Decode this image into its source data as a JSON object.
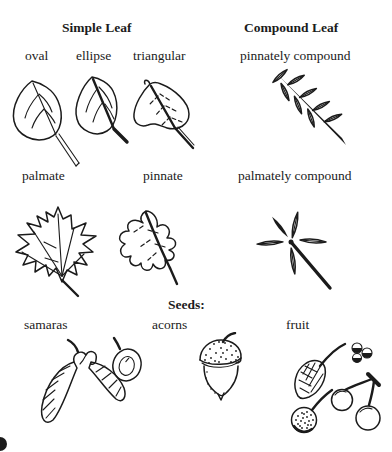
{
  "colors": {
    "ink": "#1b1b1b",
    "paper": "#ffffff"
  },
  "headings": {
    "simple_leaf": "Simple Leaf",
    "compound_leaf": "Compound Leaf",
    "seeds": "Seeds:"
  },
  "labels": {
    "oval": "oval",
    "ellipse": "ellipse",
    "triangular": "triangular",
    "pinnately_compound": "pinnately compound",
    "palmate": "palmate",
    "pinnate": "pinnate",
    "palmately_compound": "palmately compound",
    "samaras": "samaras",
    "acorns": "acorns",
    "fruit": "fruit"
  },
  "illustrations": [
    "oval-leaf",
    "ellipse-leaf",
    "triangular-leaf",
    "pinnately-compound-leaf",
    "palmate-leaf",
    "pinnate-leaf",
    "palmately-compound-leaf",
    "samaras",
    "acorn",
    "fruit-cluster"
  ]
}
